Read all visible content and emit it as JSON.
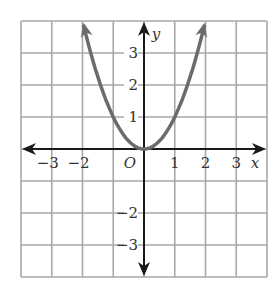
{
  "chart_data": {
    "type": "line",
    "title": "",
    "function": "y = x^2",
    "xlabel": "x",
    "ylabel": "y",
    "origin_label": "O",
    "xlim": [
      -4,
      4
    ],
    "ylim": [
      -4,
      4
    ],
    "grid": true,
    "x_ticks": [
      "-3",
      "-2",
      "1",
      "2",
      "3"
    ],
    "y_ticks": [
      "3",
      "2",
      "1",
      "-2",
      "-3"
    ],
    "series": [
      {
        "name": "parabola",
        "x": [
          -1.97,
          -1.5,
          -1,
          -0.5,
          0,
          0.5,
          1,
          1.5,
          1.97
        ],
        "y": [
          3.88,
          2.25,
          1,
          0.25,
          0,
          0.25,
          1,
          2.25,
          3.88
        ]
      }
    ],
    "colors": {
      "grid": "#a8a8a8",
      "axes": "#1a1a1a",
      "curve": "#6b6b6b"
    }
  }
}
